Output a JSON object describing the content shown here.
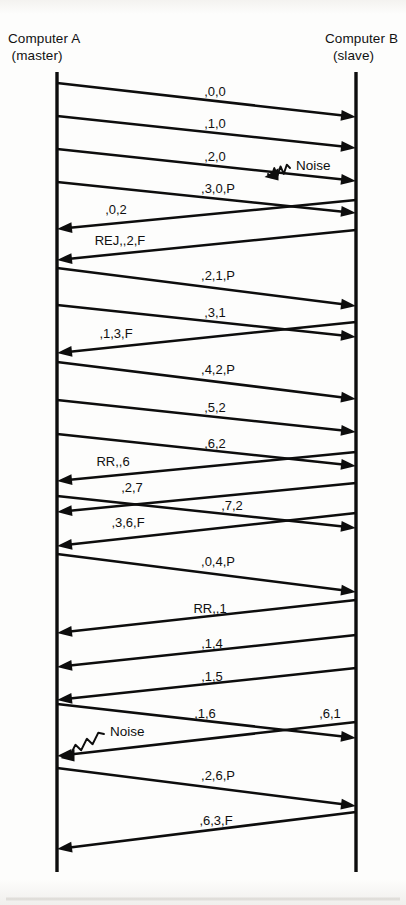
{
  "diagram": {
    "title_left": "Computer A",
    "subtitle_left": "(master)",
    "title_right": "Computer B",
    "subtitle_right": "(slave)",
    "line_color": "#0d0d0d",
    "background_color": "#fdfdfc",
    "left_lifeline_x": 57,
    "right_lifeline_x": 356,
    "lifeline_top": 72,
    "lifeline_bottom": 872
  },
  "chart_data": {
    "type": "sequence-timing-diagram",
    "participants": [
      {
        "id": "A",
        "name": "Computer A",
        "role": "(master)",
        "x": 57
      },
      {
        "id": "B",
        "name": "Computer B",
        "role": "(slave)",
        "x": 356
      }
    ],
    "messages": [
      {
        "label": ",0,0",
        "from": "A",
        "to": "B",
        "y_start": 83,
        "y_end": 117,
        "label_x": 215,
        "label_y": 96,
        "truncated": false
      },
      {
        "label": ",1,0",
        "from": "A",
        "to": "B",
        "y_start": 116,
        "y_end": 148,
        "label_x": 215,
        "label_y": 128,
        "truncated": false
      },
      {
        "label": ",2,0",
        "from": "A",
        "to": "B",
        "y_start": 149,
        "y_end": 181,
        "label_x": 215,
        "label_y": 161,
        "truncated": false
      },
      {
        "label": ",3,0,P",
        "from": "A",
        "to": "B",
        "y_start": 182,
        "y_end": 213,
        "label_x": 218,
        "label_y": 193,
        "truncated": false
      },
      {
        "label": ",0,2",
        "from": "B",
        "to": "A",
        "y_start": 200,
        "y_end": 229,
        "label_x": 116,
        "label_y": 214,
        "truncated": false
      },
      {
        "label": "REJ,,2,F",
        "from": "B",
        "to": "A",
        "y_start": 230,
        "y_end": 260,
        "label_x": 120,
        "label_y": 245,
        "truncated": false
      },
      {
        "label": ",2,1,P",
        "from": "A",
        "to": "B",
        "y_start": 268,
        "y_end": 306,
        "label_x": 218,
        "label_y": 280,
        "truncated": false
      },
      {
        "label": ",3,1",
        "from": "A",
        "to": "B",
        "y_start": 305,
        "y_end": 337,
        "label_x": 215,
        "label_y": 317,
        "truncated": false
      },
      {
        "label": ",1,3,F",
        "from": "B",
        "to": "A",
        "y_start": 322,
        "y_end": 353,
        "label_x": 116,
        "label_y": 338,
        "truncated": false
      },
      {
        "label": ",4,2,P",
        "from": "A",
        "to": "B",
        "y_start": 362,
        "y_end": 399,
        "label_x": 218,
        "label_y": 374,
        "truncated": false
      },
      {
        "label": ",5,2",
        "from": "A",
        "to": "B",
        "y_start": 400,
        "y_end": 432,
        "label_x": 215,
        "label_y": 412,
        "truncated": false
      },
      {
        "label": ",6,2",
        "from": "A",
        "to": "B",
        "y_start": 434,
        "y_end": 466,
        "label_x": 215,
        "label_y": 448,
        "truncated": false
      },
      {
        "label": "RR,,6",
        "from": "B",
        "to": "A",
        "y_start": 452,
        "y_end": 481,
        "label_x": 113,
        "label_y": 466,
        "truncated": false
      },
      {
        "label": ",2,7",
        "from": "B",
        "to": "A",
        "y_start": 483,
        "y_end": 512,
        "label_x": 132,
        "label_y": 492,
        "truncated": false
      },
      {
        "label": ",7,2",
        "from": "A",
        "to": "B",
        "y_start": 496,
        "y_end": 528,
        "label_x": 232,
        "label_y": 510,
        "truncated": false
      },
      {
        "label": ",3,6,F",
        "from": "B",
        "to": "A",
        "y_start": 513,
        "y_end": 546,
        "label_x": 128,
        "label_y": 527,
        "truncated": false
      },
      {
        "label": ",0,4,P",
        "from": "A",
        "to": "B",
        "y_start": 554,
        "y_end": 592,
        "label_x": 218,
        "label_y": 566,
        "truncated": false
      },
      {
        "label": "RR,,1",
        "from": "B",
        "to": "A",
        "y_start": 600,
        "y_end": 633,
        "label_x": 210,
        "label_y": 613,
        "truncated": false
      },
      {
        "label": ",1,4",
        "from": "B",
        "to": "A",
        "y_start": 635,
        "y_end": 667,
        "label_x": 212,
        "label_y": 648,
        "truncated": false
      },
      {
        "label": ",1,5",
        "from": "B",
        "to": "A",
        "y_start": 668,
        "y_end": 700,
        "label_x": 212,
        "label_y": 681,
        "truncated": false
      },
      {
        "label": ",1,6",
        "from": "A",
        "to": "B",
        "y_start": 704,
        "y_end": 738,
        "label_x": 205,
        "label_y": 718,
        "truncated": false
      },
      {
        "label": ",6,1",
        "from": "B",
        "to": "A",
        "y_start": 722,
        "y_end": 756,
        "label_x": 330,
        "label_y": 718,
        "truncated": false
      },
      {
        "label": ",2,6,P",
        "from": "A",
        "to": "B",
        "y_start": 768,
        "y_end": 806,
        "label_x": 218,
        "label_y": 780,
        "truncated": false
      },
      {
        "label": ",6,3,F",
        "from": "B",
        "to": "A",
        "y_start": 812,
        "y_end": 849,
        "label_x": 216,
        "label_y": 825,
        "truncated": false
      }
    ],
    "annotations": [
      {
        "label": "Noise",
        "x": 296,
        "y": 170,
        "target_x": 268,
        "target_y": 174,
        "points_to_message": ",2,0"
      },
      {
        "label": "Noise",
        "x": 110,
        "y": 736,
        "target_x": 64,
        "target_y": 755,
        "points_to_message": ",1,6"
      }
    ]
  }
}
